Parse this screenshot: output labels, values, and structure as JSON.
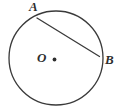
{
  "figure": {
    "background_color": "#ffffff",
    "stroke_color": "#3a3a3a",
    "label_color": "#2e2e2e",
    "labels": {
      "center": "O",
      "point_a": "A",
      "point_b": "B"
    },
    "geometry": {
      "circle": {
        "cx": 56,
        "cy": 58,
        "r": 47,
        "stroke_width": 1.3
      },
      "center_dot": {
        "cx": 54.5,
        "cy": 59.5,
        "r": 1.9
      },
      "chord": {
        "x1": 37,
        "y1": 18,
        "x2": 99.5,
        "y2": 56.5,
        "stroke_width": 1.3
      }
    }
  }
}
